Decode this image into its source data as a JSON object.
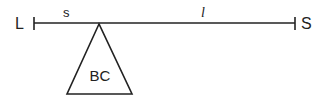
{
  "diagram": {
    "left_end_label": "L",
    "right_end_label": "S",
    "segment_short_label": "s",
    "segment_long_label": "l",
    "fulcrum_label": "BC",
    "line_color": "#222222"
  }
}
